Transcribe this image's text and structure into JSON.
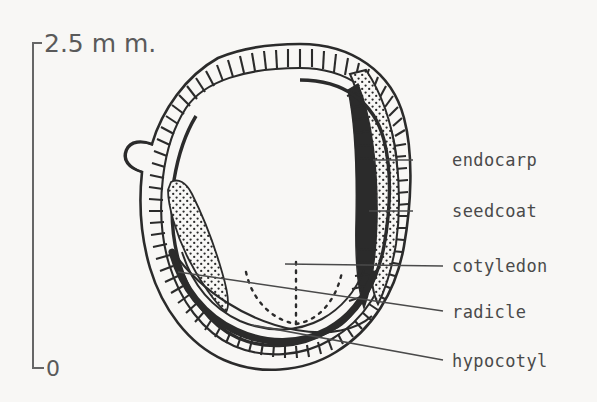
{
  "figure": {
    "kind": "botanical-cross-section-diagram",
    "background_color": "#f8f7f5",
    "ink_color": "#2b2b2b",
    "text_color": "#4a4a4a"
  },
  "scale_bar": {
    "top_label": "2.5 m m.",
    "bottom_label": "0",
    "orientation": "vertical",
    "top_y": 42,
    "bottom_y": 368,
    "x": 33
  },
  "labels": [
    {
      "id": "endocarp",
      "text": "endocarp",
      "x": 452,
      "y": 166,
      "leader_from_x": 413,
      "leader_from_y": 160,
      "leader_to_x": 373,
      "leader_to_y": 160
    },
    {
      "id": "seedcoat",
      "text": "seedcoat",
      "x": 452,
      "y": 216,
      "leader_from_x": 413,
      "leader_from_y": 211,
      "leader_to_x": 369,
      "leader_to_y": 211
    },
    {
      "id": "cotyledon",
      "text": "cotyledon",
      "x": 452,
      "y": 271,
      "leader_from_x": 443,
      "leader_from_y": 266,
      "leader_to_x": 285,
      "leader_to_y": 264
    },
    {
      "id": "radicle",
      "text": "radicle",
      "x": 452,
      "y": 317,
      "leader_from_x": 443,
      "leader_from_y": 311,
      "leader_to_x": 178,
      "leader_to_y": 272
    },
    {
      "id": "hypocotyl",
      "text": "hypocotyl",
      "x": 452,
      "y": 366,
      "leader_from_x": 443,
      "leader_from_y": 360,
      "leader_to_x": 252,
      "leader_to_y": 325
    }
  ],
  "structures": {
    "pericarp_wall": "outer hatched band",
    "endocarp_layer": "stippled protruding ridge on right flank",
    "seedcoat_layer": "thin dark inner band",
    "cotyledon_wedge": "stippled triangular mass upper-left interior",
    "hypocotyl_band": "thick dark band along lower interior",
    "radicle_outline": "dotted curve in lower interior"
  }
}
